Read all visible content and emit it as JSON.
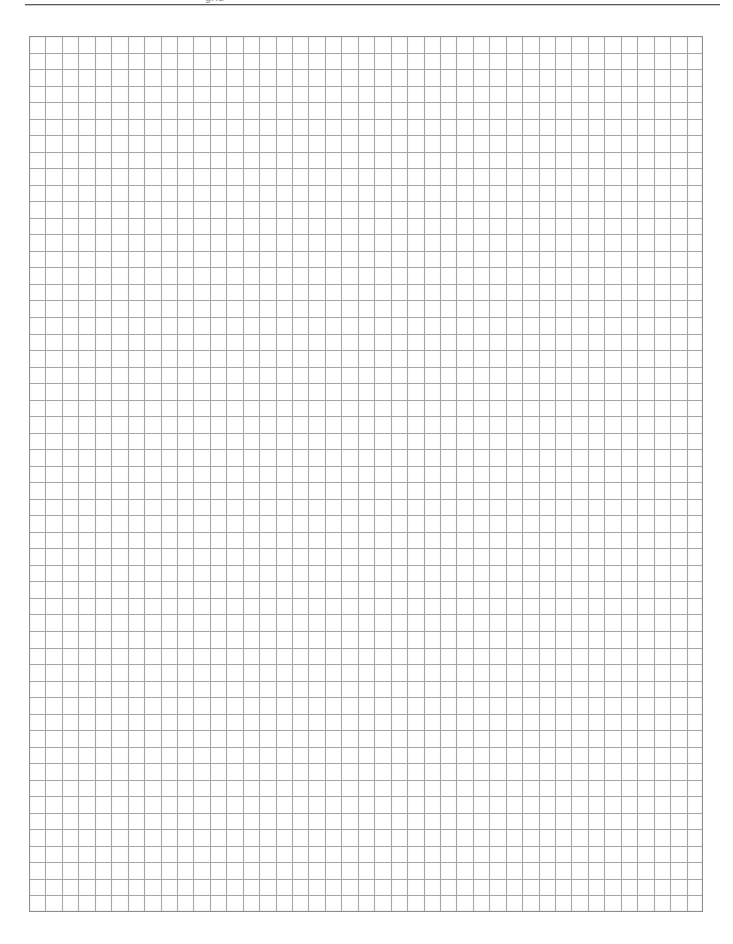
{
  "document": {
    "type": "graph-paper",
    "title": "Graph Paper",
    "header_partial_text": "grid",
    "page_background": "#ffffff"
  },
  "top_rule": {
    "color": "#5a5a5a",
    "shadow_color": "#c9c9c9",
    "left": 25,
    "width": 695
  },
  "chart_data": {
    "type": "table",
    "subtitle": "",
    "xlabel": "",
    "ylabel": "",
    "columns": 41,
    "rows": 53,
    "cell_size_px": 16.6,
    "grid": true,
    "legend": "none",
    "line_color": "#a6a6a6",
    "border_color": "#8e8e8e",
    "background_color": "#ffffff",
    "origin_x_px": 29,
    "origin_y_px": 36,
    "grid_width_px": 674,
    "grid_height_px": 876,
    "categories": [],
    "values": []
  }
}
